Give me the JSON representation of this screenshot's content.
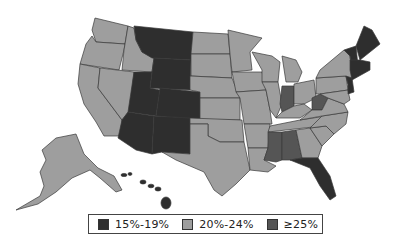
{
  "map": {
    "title": "",
    "type": "choropleth",
    "region": "United States",
    "categories": [
      {
        "id": "c1",
        "label": "15%-19%",
        "color": "#2e2e2e"
      },
      {
        "id": "c2",
        "label": "20%-24%",
        "color": "#9e9e9e"
      },
      {
        "id": "c3",
        "label": "≥25%",
        "color": "#555555"
      }
    ],
    "states": {
      "15%-19%": [
        "MT",
        "WY",
        "UT",
        "CO",
        "AZ",
        "NM",
        "FL",
        "ME",
        "NH",
        "VT",
        "MA",
        "CT",
        "RI",
        "NJ",
        "HI"
      ],
      "20%-24%": [
        "WA",
        "OR",
        "CA",
        "NV",
        "ID",
        "ND",
        "SD",
        "NE",
        "KS",
        "OK",
        "TX",
        "MN",
        "IA",
        "MO",
        "AR",
        "LA",
        "WI",
        "IL",
        "MI",
        "OH",
        "KY",
        "TN",
        "GA",
        "SC",
        "NC",
        "VA",
        "PA",
        "NY",
        "MD",
        "DE",
        "AK"
      ],
      "≥25%": [
        "IN",
        "WV",
        "MS",
        "AL"
      ]
    }
  },
  "legend": {
    "items": [
      {
        "label": "15%-19%",
        "color": "#2e2e2e"
      },
      {
        "label": "20%-24%",
        "color": "#9e9e9e"
      },
      {
        "label": "≥25%",
        "color": "#555555"
      }
    ]
  }
}
